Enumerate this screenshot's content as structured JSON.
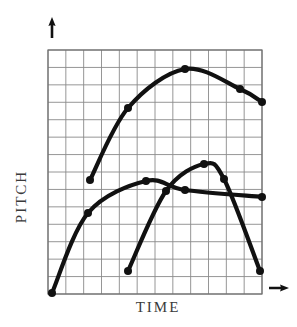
{
  "figure": {
    "title": "",
    "background_color": "#ffffff",
    "width": 297,
    "height": 327
  },
  "axes": {
    "y": {
      "label": "PITCH",
      "arrow_icon": "arrow-up-icon",
      "arrow": {
        "x": 52,
        "y_top": 17,
        "y_bottom": 38
      }
    },
    "x": {
      "label": "TIME",
      "arrow_icon": "arrow-right-icon",
      "arrow": {
        "y": 288,
        "x_left": 269,
        "x_right": 289
      }
    }
  },
  "grid": {
    "x0": 48,
    "y0": 50,
    "x1": 262,
    "y1": 294,
    "cols": 12,
    "rows": 14,
    "line_color": "#8a8a8a",
    "line_width": 0.9,
    "border_color": "#6f6f6f",
    "border_width": 1.2,
    "visible": true
  },
  "style": {
    "curve_color": "#111111",
    "curve_width": 4.2,
    "marker_color": "#111111",
    "marker_radius": 4.0,
    "text_color": "#3a3a3a"
  },
  "chart_data": {
    "type": "line",
    "title": "",
    "xlabel": "TIME",
    "ylabel": "PITCH",
    "xlim": [
      48,
      262
    ],
    "ylim": [
      294,
      50
    ],
    "grid": true,
    "legend": "none",
    "axis_ticks": "none",
    "note": "Three schematic pitch contours over time; axes are unlabeled/unscaled with arrowheads indicating direction of increase.",
    "series": [
      {
        "name": "contour-high-rise-fall",
        "color": "#111111",
        "points": [
          {
            "x": 90,
            "y": 180
          },
          {
            "x": 128,
            "y": 108
          },
          {
            "x": 185,
            "y": 69
          },
          {
            "x": 240,
            "y": 89
          },
          {
            "x": 262,
            "y": 102
          }
        ]
      },
      {
        "name": "contour-low-rise-plateau",
        "color": "#111111",
        "points": [
          {
            "x": 52,
            "y": 293
          },
          {
            "x": 88,
            "y": 213
          },
          {
            "x": 146,
            "y": 181
          },
          {
            "x": 185,
            "y": 190
          },
          {
            "x": 262,
            "y": 197
          }
        ]
      },
      {
        "name": "contour-late-rise-fall",
        "color": "#111111",
        "points": [
          {
            "x": 128,
            "y": 271
          },
          {
            "x": 166,
            "y": 191
          },
          {
            "x": 204,
            "y": 164
          },
          {
            "x": 224,
            "y": 179
          },
          {
            "x": 260,
            "y": 271
          }
        ]
      }
    ]
  }
}
